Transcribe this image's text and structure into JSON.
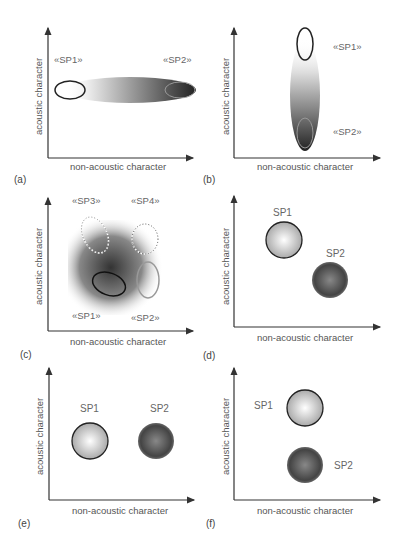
{
  "figure": {
    "x_axis_label": "non-acoustic character",
    "y_axis_label": "acoustic character",
    "panels": [
      {
        "id": "a",
        "label": "(a)",
        "species": [
          "«SP1»",
          "«SP2»"
        ]
      },
      {
        "id": "b",
        "label": "(b)",
        "species": [
          "«SP1»",
          "«SP2»"
        ]
      },
      {
        "id": "c",
        "label": "(c)",
        "species": [
          "«SP3»",
          "«SP4»",
          "«SP1»",
          "«SP2»"
        ]
      },
      {
        "id": "d",
        "label": "(d)",
        "species": [
          "SP1",
          "SP2"
        ]
      },
      {
        "id": "e",
        "label": "(e)",
        "species": [
          "SP1",
          "SP2"
        ]
      },
      {
        "id": "f",
        "label": "(f)",
        "species": [
          "SP1",
          "SP2"
        ]
      }
    ]
  }
}
